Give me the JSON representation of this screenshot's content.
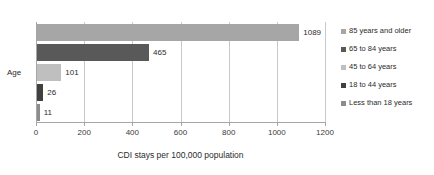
{
  "chart_data": {
    "type": "bar",
    "orientation": "horizontal",
    "title": "",
    "xlabel": "CDI stays per 100,000 population",
    "ylabel": "Age",
    "categories": [
      "85 years and older",
      "65 to 84 years",
      "45 to 64 years",
      "18 to 44 years",
      "Less than 18 years"
    ],
    "values": [
      1089,
      465,
      101,
      26,
      11
    ],
    "data_labels": [
      "1089",
      "465",
      "101",
      "26",
      "11"
    ],
    "colors": [
      "#a6a6a6",
      "#595959",
      "#bfbfbf",
      "#404040",
      "#8c8c8c"
    ],
    "xlim": [
      0,
      1200
    ],
    "xticks": [
      0,
      200,
      400,
      600,
      800,
      1000,
      1200
    ],
    "xtick_labels": [
      "0",
      "200",
      "400",
      "600",
      "800",
      "1000",
      "1200"
    ],
    "grid": "vertical",
    "legend_position": "right",
    "legend_entries": [
      "85 years and older",
      "65 to 84 years",
      "45 to 64 years",
      "18 to 44 years",
      "Less than 18 years"
    ]
  }
}
